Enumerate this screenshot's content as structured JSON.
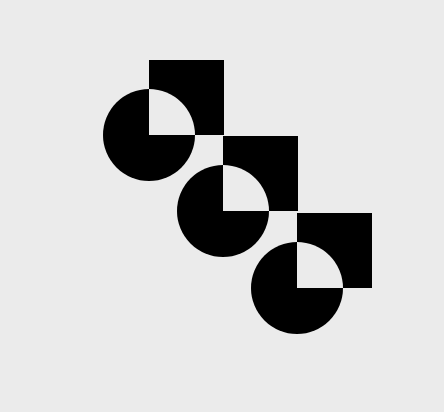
{
  "image": {
    "description": "Three interlocking circle-and-square motifs arranged diagonally; overlapping quadrant rendered in background color",
    "colors": {
      "background": "#ebebeb",
      "shape": "#000000"
    },
    "motifs": [
      {
        "name": "motif-1"
      },
      {
        "name": "motif-2"
      },
      {
        "name": "motif-3"
      }
    ]
  }
}
